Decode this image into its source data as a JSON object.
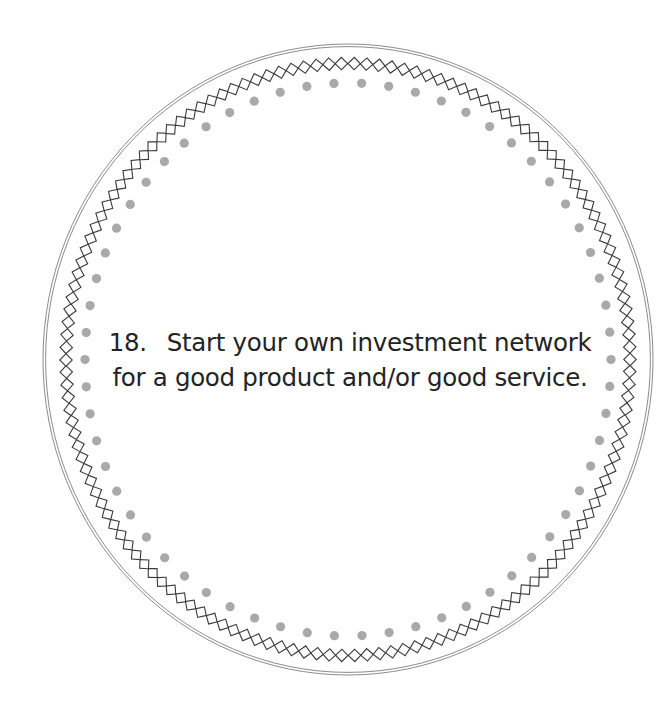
{
  "card": {
    "number": "18.",
    "line1": "Start your own investment network",
    "line2": "for a good product and/or good service."
  },
  "decoration": {
    "center": [
      348,
      359.5
    ],
    "outer_ring": {
      "rx": 305,
      "ry": 315.5,
      "gap": 2.6,
      "color": "#8c8c8c"
    },
    "diamond_chain": {
      "rx": 282,
      "ry": 296,
      "count": 146,
      "size": 8.8,
      "color": "#3a3a3a"
    },
    "dots": {
      "rx": 263,
      "ry": 276.5,
      "count": 62,
      "radius": 4.6,
      "color": "#a9a9a9"
    }
  },
  "icons": {
    "outer_ring": "double-ellipse-border",
    "diamond_chain": "diamond-chain-border",
    "dots": "dotted-ring-border"
  }
}
